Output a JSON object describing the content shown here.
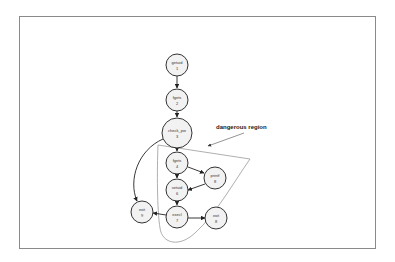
{
  "annotation": {
    "label": "dangerous region"
  },
  "nodes": [
    {
      "id": "n1",
      "name": "getuid",
      "num": "1",
      "cx": 177,
      "cy": 65,
      "r": 11
    },
    {
      "id": "n2",
      "name": "fgets",
      "num": "2",
      "cx": 177,
      "cy": 100,
      "r": 11
    },
    {
      "id": "n3",
      "name": "check_pw",
      "num": "3",
      "cx": 177,
      "cy": 133,
      "r": 15
    },
    {
      "id": "n4",
      "name": "fgets",
      "num": "4",
      "cx": 177,
      "cy": 163,
      "r": 11
    },
    {
      "id": "n5",
      "name": "printf",
      "num": "8",
      "cx": 215,
      "cy": 178,
      "r": 11
    },
    {
      "id": "n6",
      "name": "setuid",
      "num": "6",
      "cx": 177,
      "cy": 190,
      "r": 11
    },
    {
      "id": "n7",
      "name": "execl",
      "num": "7",
      "cx": 177,
      "cy": 217,
      "r": 11
    },
    {
      "id": "n8",
      "name": "exit",
      "num": "9",
      "cx": 142,
      "cy": 212,
      "r": 11
    },
    {
      "id": "n9",
      "name": "exit",
      "num": "8",
      "cx": 216,
      "cy": 218,
      "r": 11
    }
  ],
  "edges": [
    {
      "from": "getuid 1",
      "to": "fgets 2"
    },
    {
      "from": "fgets 2",
      "to": "check_pw 3"
    },
    {
      "from": "check_pw 3",
      "to": "fgets 4"
    },
    {
      "from": "check_pw 3",
      "to": "exit 9"
    },
    {
      "from": "fgets 4",
      "to": "printf 8"
    },
    {
      "from": "fgets 4",
      "to": "setuid 6"
    },
    {
      "from": "printf 8",
      "to": "setuid 6"
    },
    {
      "from": "setuid 6",
      "to": "execl 7"
    },
    {
      "from": "execl 7",
      "to": "exit 9"
    },
    {
      "from": "execl 7",
      "to": "exit 8"
    }
  ]
}
